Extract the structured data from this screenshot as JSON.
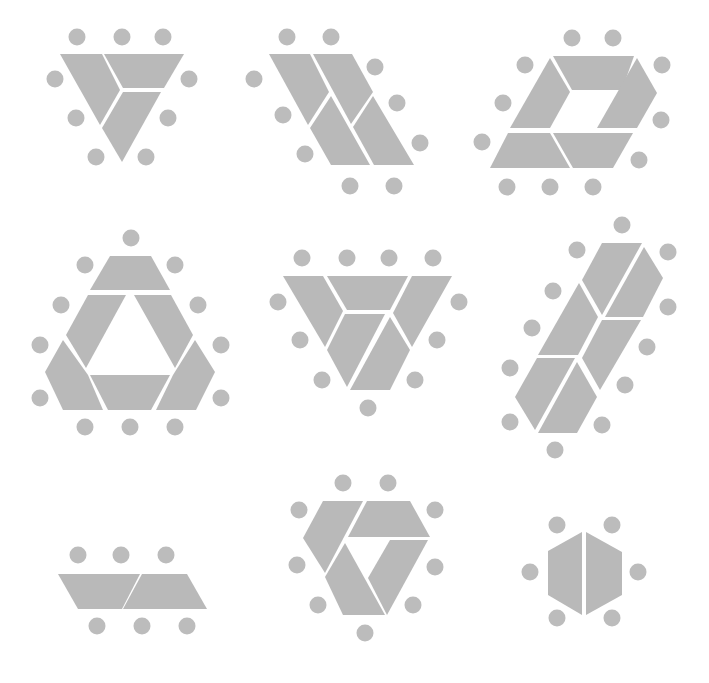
{
  "colors": {
    "piece": "#b9b9b9",
    "dot": "#bcbcbc",
    "background": "#ffffff"
  },
  "dot_radius": 8.5,
  "figures": [
    {
      "name": "figure-1-inverted-triangle-3-pieces",
      "pieces": [
        [
          [
            60,
            54
          ],
          [
            102,
            54
          ],
          [
            120,
            90
          ],
          [
            100,
            125
          ]
        ],
        [
          [
            104,
            54
          ],
          [
            184,
            54
          ],
          [
            164,
            88
          ],
          [
            123,
            88
          ]
        ],
        [
          [
            123,
            92
          ],
          [
            161,
            92
          ],
          [
            122,
            162
          ],
          [
            102,
            128
          ]
        ]
      ],
      "dots": [
        [
          77,
          37
        ],
        [
          122,
          37
        ],
        [
          163,
          37
        ],
        [
          55,
          79
        ],
        [
          189,
          79
        ],
        [
          76,
          118
        ],
        [
          168,
          118
        ],
        [
          96,
          157
        ],
        [
          146,
          157
        ]
      ]
    },
    {
      "name": "figure-2-parallelogram-4-pieces",
      "pieces": [
        [
          [
            269,
            54
          ],
          [
            310,
            54
          ],
          [
            329,
            92
          ],
          [
            308,
            125
          ]
        ],
        [
          [
            313,
            54
          ],
          [
            352,
            54
          ],
          [
            373,
            92
          ],
          [
            351,
            124
          ]
        ],
        [
          [
            331,
            96
          ],
          [
            370,
            165
          ],
          [
            331,
            165
          ],
          [
            310,
            128
          ]
        ],
        [
          [
            373,
            96
          ],
          [
            414,
            165
          ],
          [
            374,
            165
          ],
          [
            353,
            127
          ]
        ]
      ],
      "dots": [
        [
          287,
          37
        ],
        [
          331,
          37
        ],
        [
          375,
          67
        ],
        [
          254,
          79
        ],
        [
          397,
          103
        ],
        [
          283,
          115
        ],
        [
          420,
          143
        ],
        [
          305,
          154
        ],
        [
          350,
          186
        ],
        [
          394,
          186
        ]
      ]
    },
    {
      "name": "figure-3-hexagonal-ring-5-pieces",
      "pieces": [
        [
          [
            553,
            56
          ],
          [
            634,
            56
          ],
          [
            622,
            90
          ],
          [
            572,
            90
          ]
        ],
        [
          [
            550,
            58
          ],
          [
            570,
            92
          ],
          [
            550,
            128
          ],
          [
            510,
            128
          ]
        ],
        [
          [
            637,
            58
          ],
          [
            657,
            93
          ],
          [
            637,
            128
          ],
          [
            597,
            128
          ]
        ],
        [
          [
            508,
            133
          ],
          [
            550,
            133
          ],
          [
            570,
            168
          ],
          [
            490,
            168
          ]
        ],
        [
          [
            553,
            133
          ],
          [
            633,
            133
          ],
          [
            613,
            168
          ],
          [
            573,
            168
          ]
        ]
      ],
      "dots": [
        [
          572,
          38
        ],
        [
          613,
          38
        ],
        [
          525,
          65
        ],
        [
          662,
          65
        ],
        [
          503,
          103
        ],
        [
          661,
          120
        ],
        [
          482,
          142
        ],
        [
          639,
          160
        ],
        [
          507,
          187
        ],
        [
          550,
          187
        ],
        [
          593,
          187
        ]
      ]
    },
    {
      "name": "figure-4-triangle-ring-6-pieces",
      "pieces": [
        [
          [
            110,
            256
          ],
          [
            151,
            256
          ],
          [
            170,
            290
          ],
          [
            90,
            290
          ]
        ],
        [
          [
            88,
            295
          ],
          [
            126,
            295
          ],
          [
            86,
            368
          ],
          [
            66,
            335
          ]
        ],
        [
          [
            134,
            295
          ],
          [
            171,
            295
          ],
          [
            193,
            335
          ],
          [
            175,
            368
          ]
        ],
        [
          [
            63,
            340
          ],
          [
            88,
            375
          ],
          [
            103,
            410
          ],
          [
            63,
            410
          ],
          [
            45,
            372
          ]
        ],
        [
          [
            90,
            375
          ],
          [
            170,
            375
          ],
          [
            151,
            410
          ],
          [
            108,
            410
          ]
        ],
        [
          [
            195,
            340
          ],
          [
            215,
            372
          ],
          [
            196,
            410
          ],
          [
            156,
            410
          ],
          [
            173,
            375
          ]
        ]
      ],
      "dots": [
        [
          131,
          238
        ],
        [
          85,
          265
        ],
        [
          175,
          265
        ],
        [
          61,
          305
        ],
        [
          198,
          305
        ],
        [
          40,
          345
        ],
        [
          221,
          345
        ],
        [
          40,
          398
        ],
        [
          221,
          398
        ],
        [
          85,
          427
        ],
        [
          130,
          427
        ],
        [
          175,
          427
        ]
      ]
    },
    {
      "name": "figure-5-inverted-trapezoid-5-pieces",
      "pieces": [
        [
          [
            283,
            276
          ],
          [
            323,
            276
          ],
          [
            343,
            311
          ],
          [
            325,
            347
          ]
        ],
        [
          [
            327,
            276
          ],
          [
            408,
            276
          ],
          [
            390,
            310
          ],
          [
            347,
            310
          ]
        ],
        [
          [
            412,
            276
          ],
          [
            452,
            276
          ],
          [
            412,
            347
          ],
          [
            393,
            313
          ]
        ],
        [
          [
            345,
            314
          ],
          [
            385,
            314
          ],
          [
            347,
            387
          ],
          [
            327,
            350
          ]
        ],
        [
          [
            390,
            317
          ],
          [
            410,
            350
          ],
          [
            390,
            390
          ],
          [
            350,
            390
          ]
        ]
      ],
      "dots": [
        [
          302,
          258
        ],
        [
          347,
          258
        ],
        [
          389,
          258
        ],
        [
          433,
          258
        ],
        [
          278,
          302
        ],
        [
          459,
          302
        ],
        [
          300,
          340
        ],
        [
          437,
          340
        ],
        [
          322,
          380
        ],
        [
          415,
          380
        ],
        [
          368,
          408
        ]
      ]
    },
    {
      "name": "figure-6-slanted-bar-6-pieces",
      "pieces": [
        [
          [
            602,
            243
          ],
          [
            642,
            243
          ],
          [
            602,
            315
          ],
          [
            582,
            280
          ]
        ],
        [
          [
            644,
            247
          ],
          [
            663,
            278
          ],
          [
            643,
            317
          ],
          [
            605,
            317
          ]
        ],
        [
          [
            579,
            283
          ],
          [
            598,
            317
          ],
          [
            578,
            355
          ],
          [
            538,
            355
          ]
        ],
        [
          [
            602,
            320
          ],
          [
            641,
            320
          ],
          [
            600,
            390
          ],
          [
            582,
            358
          ]
        ],
        [
          [
            537,
            358
          ],
          [
            575,
            358
          ],
          [
            535,
            430
          ],
          [
            515,
            397
          ]
        ],
        [
          [
            577,
            362
          ],
          [
            597,
            397
          ],
          [
            577,
            433
          ],
          [
            538,
            433
          ]
        ]
      ],
      "dots": [
        [
          622,
          225
        ],
        [
          577,
          250
        ],
        [
          668,
          252
        ],
        [
          553,
          291
        ],
        [
          668,
          307
        ],
        [
          532,
          328
        ],
        [
          647,
          347
        ],
        [
          510,
          368
        ],
        [
          625,
          385
        ],
        [
          510,
          422
        ],
        [
          602,
          425
        ],
        [
          555,
          450
        ]
      ]
    },
    {
      "name": "figure-7-two-trapezoids",
      "pieces": [
        [
          [
            58,
            574
          ],
          [
            140,
            574
          ],
          [
            122,
            609
          ],
          [
            78,
            609
          ]
        ],
        [
          [
            142,
            574
          ],
          [
            187,
            574
          ],
          [
            207,
            609
          ],
          [
            123,
            609
          ]
        ]
      ],
      "dots": [
        [
          78,
          555
        ],
        [
          121,
          555
        ],
        [
          166,
          555
        ],
        [
          97,
          626
        ],
        [
          142,
          626
        ],
        [
          187,
          626
        ]
      ]
    },
    {
      "name": "figure-8-pinwheel-4-pieces",
      "pieces": [
        [
          [
            323,
            501
          ],
          [
            363,
            501
          ],
          [
            325,
            573
          ],
          [
            303,
            538
          ]
        ],
        [
          [
            367,
            501
          ],
          [
            410,
            501
          ],
          [
            430,
            537
          ],
          [
            348,
            537
          ]
        ],
        [
          [
            345,
            543
          ],
          [
            385,
            615
          ],
          [
            343,
            615
          ],
          [
            325,
            577
          ]
        ],
        [
          [
            390,
            540
          ],
          [
            428,
            540
          ],
          [
            387,
            615
          ],
          [
            368,
            578
          ]
        ]
      ],
      "dots": [
        [
          343,
          483
        ],
        [
          388,
          483
        ],
        [
          299,
          510
        ],
        [
          435,
          510
        ],
        [
          297,
          565
        ],
        [
          435,
          567
        ],
        [
          318,
          605
        ],
        [
          413,
          605
        ],
        [
          365,
          633
        ]
      ]
    },
    {
      "name": "figure-9-split-hexagon-2-pieces",
      "pieces": [
        [
          [
            582,
            532
          ],
          [
            582,
            615
          ],
          [
            548,
            595
          ],
          [
            548,
            551
          ]
        ],
        [
          [
            586,
            532
          ],
          [
            622,
            552
          ],
          [
            622,
            595
          ],
          [
            586,
            615
          ]
        ]
      ],
      "dots": [
        [
          557,
          525
        ],
        [
          612,
          525
        ],
        [
          530,
          572
        ],
        [
          638,
          572
        ],
        [
          557,
          618
        ],
        [
          612,
          618
        ]
      ]
    }
  ]
}
